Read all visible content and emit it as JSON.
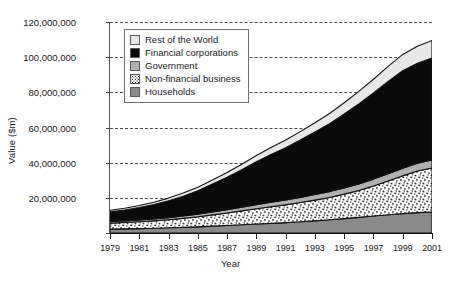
{
  "chart_data": {
    "type": "area",
    "stacked": true,
    "title": "",
    "xlabel": "Year",
    "ylabel": "Value ($m)",
    "x": [
      1979,
      1980,
      1981,
      1982,
      1983,
      1984,
      1985,
      1986,
      1987,
      1988,
      1989,
      1990,
      1991,
      1992,
      1993,
      1994,
      1995,
      1996,
      1997,
      1998,
      1999,
      2000,
      2001
    ],
    "xlim": [
      1979,
      2001
    ],
    "ylim": [
      0,
      120000000
    ],
    "yticks": [
      0,
      20000000,
      40000000,
      60000000,
      80000000,
      100000000,
      120000000
    ],
    "ytick_labels": [
      "0",
      "20,000,000",
      "40,000,000",
      "60,000,000",
      "80,000,000",
      "100,000,000",
      "120,000,000"
    ],
    "xticks": [
      1979,
      1981,
      1983,
      1985,
      1987,
      1989,
      1991,
      1993,
      1995,
      1997,
      1999,
      2001
    ],
    "xtick_labels": [
      "1979",
      "1981",
      "1983",
      "1985",
      "1987",
      "1989",
      "1991",
      "1993",
      "1995",
      "1997",
      "1999",
      "2001"
    ],
    "grid": true,
    "grid_axis": "y",
    "grid_style": "dashed",
    "legend_position": "top-left-inside",
    "series": [
      {
        "name": "Households",
        "color": "#8a8a8a",
        "pattern": "solid",
        "values": [
          2200000,
          2350000,
          2500000,
          2700000,
          2950000,
          3200000,
          3500000,
          3900000,
          4300000,
          4700000,
          5100000,
          5500000,
          5900000,
          6400000,
          6900000,
          7500000,
          8200000,
          8900000,
          9700000,
          10400000,
          11000000,
          11600000,
          12000000
        ]
      },
      {
        "name": "Non-financial business",
        "color": "#ffffff",
        "pattern": "speckle",
        "values": [
          3400000,
          3600000,
          3900000,
          4200000,
          4600000,
          5100000,
          5700000,
          6400000,
          7100000,
          7900000,
          8700000,
          9400000,
          10100000,
          10900000,
          11800000,
          12700000,
          13900000,
          15300000,
          17000000,
          19200000,
          21500000,
          23700000,
          25000000
        ]
      },
      {
        "name": "Government",
        "color": "#b0b0b0",
        "pattern": "solid",
        "values": [
          900000,
          950000,
          1000000,
          1100000,
          1200000,
          1350000,
          1500000,
          1700000,
          1900000,
          2100000,
          2350000,
          2550000,
          2750000,
          2950000,
          3150000,
          3350000,
          3550000,
          3750000,
          3950000,
          4150000,
          4350000,
          4450000,
          4500000
        ]
      },
      {
        "name": "Financial corporations",
        "color": "#0a0a0a",
        "pattern": "solid",
        "values": [
          5500000,
          6200000,
          7100000,
          8200000,
          9600000,
          11300000,
          13300000,
          15800000,
          18400000,
          21300000,
          24400000,
          27200000,
          29800000,
          32600000,
          35600000,
          38600000,
          42000000,
          45500000,
          49000000,
          52500000,
          55500000,
          56800000,
          58000000
        ]
      },
      {
        "name": "Rest of the World",
        "color": "#e8e8e8",
        "pattern": "solid",
        "values": [
          900000,
          1000000,
          1150000,
          1300000,
          1500000,
          1750000,
          2000000,
          2350000,
          2700000,
          3100000,
          3550000,
          3950000,
          4350000,
          4800000,
          5300000,
          5850000,
          6450000,
          7100000,
          7800000,
          8500000,
          9200000,
          9700000,
          10000000
        ]
      }
    ],
    "totals": [
      12900000,
      14100000,
      15650000,
      17500000,
      19850000,
      22700000,
      26000000,
      30150000,
      34400000,
      39100000,
      44100000,
      48600000,
      52900000,
      57650000,
      62750000,
      68000000,
      74100000,
      80550000,
      87450000,
      94750000,
      101550000,
      106250000,
      109500000
    ]
  },
  "legend": {
    "items": [
      {
        "label": "Rest of the World",
        "swatch": "#e8e8e8",
        "pattern": "solid"
      },
      {
        "label": "Financial corporations",
        "swatch": "#0a0a0a",
        "pattern": "solid"
      },
      {
        "label": "Government",
        "swatch": "#b0b0b0",
        "pattern": "solid"
      },
      {
        "label": "Non-financial business",
        "swatch": "#ffffff",
        "pattern": "speckle"
      },
      {
        "label": "Households",
        "swatch": "#8a8a8a",
        "pattern": "solid"
      }
    ]
  }
}
